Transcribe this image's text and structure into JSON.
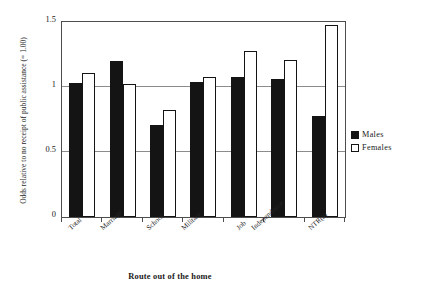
{
  "chart_data": {
    "type": "bar",
    "title": "",
    "xlabel": "Route out of the home",
    "ylabel": "Odds relative to no receipt of public assistance (= 1.00)",
    "categories": [
      "Total",
      "Marriage",
      "School",
      "Military",
      "Job",
      "Independence",
      "NTR(a)"
    ],
    "series": [
      {
        "name": "Males",
        "color": "#141414",
        "values": [
          1.03,
          1.2,
          0.71,
          1.04,
          1.08,
          1.06,
          0.78
        ]
      },
      {
        "name": "Females",
        "color": "#ffffff",
        "values": [
          1.11,
          1.02,
          0.82,
          1.08,
          1.28,
          1.21,
          1.48
        ]
      }
    ],
    "ylim": [
      0,
      1.5
    ],
    "yticks": [
      0,
      0.5,
      1,
      1.5
    ],
    "ytick_labels": [
      "0",
      "0.5",
      "1",
      "1.5"
    ],
    "grid": "horizontal",
    "legend_position": "right"
  },
  "legend": {
    "items": [
      {
        "label": "Males"
      },
      {
        "label": "Females"
      }
    ]
  }
}
